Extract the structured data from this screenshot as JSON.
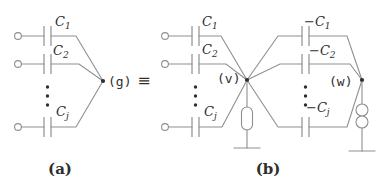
{
  "colors": {
    "background": "#ffffff",
    "line": "#8f8f8f",
    "text": "#2e2e2e"
  },
  "equivalence": {
    "symbol": "≡"
  },
  "diagram_a": {
    "caption": "(a)",
    "node_label": "(g)",
    "capacitors": [
      {
        "base": "C",
        "sub": "1"
      },
      {
        "base": "C",
        "sub": "2"
      },
      {
        "base": "C",
        "sub": "j"
      }
    ]
  },
  "diagram_b": {
    "caption": "(b)",
    "left_node_label": "(v)",
    "right_node_label": "(w)",
    "left_capacitors": [
      {
        "base": "C",
        "sub": "1"
      },
      {
        "base": "C",
        "sub": "2"
      },
      {
        "base": "C",
        "sub": "j"
      }
    ],
    "right_capacitors": [
      {
        "base": "−C",
        "sub": "1"
      },
      {
        "base": "−C",
        "sub": "2"
      },
      {
        "base": "−C",
        "sub": "j"
      }
    ]
  }
}
